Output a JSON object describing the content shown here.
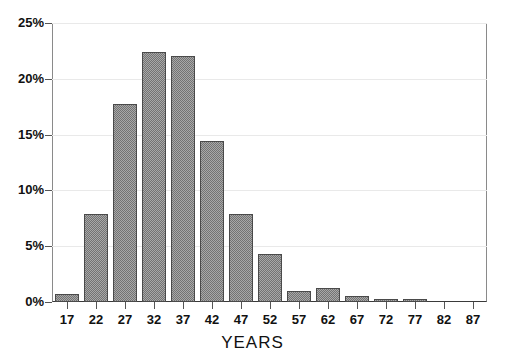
{
  "chart_data": {
    "type": "bar",
    "title": "",
    "subtitle": "",
    "xlabel": "YEARS",
    "ylabel": "",
    "categories": [
      "17",
      "22",
      "27",
      "32",
      "37",
      "42",
      "47",
      "52",
      "57",
      "62",
      "67",
      "72",
      "77",
      "82",
      "87"
    ],
    "values": [
      0.7,
      7.9,
      17.7,
      22.4,
      22.0,
      14.4,
      7.9,
      4.3,
      1.0,
      1.3,
      0.5,
      0.3,
      0.3,
      0.0,
      0.0
    ],
    "series": [
      {
        "name": "Percent",
        "values": [
          0.7,
          7.9,
          17.7,
          22.4,
          22.0,
          14.4,
          7.9,
          4.3,
          1.0,
          1.3,
          0.5,
          0.3,
          0.3,
          0.0,
          0.0
        ]
      }
    ],
    "ylim": [
      0,
      25
    ],
    "yticks": [
      0,
      5,
      10,
      15,
      20,
      25
    ],
    "ytick_labels": [
      "0%",
      "5%",
      "10%",
      "15%",
      "20%",
      "25%"
    ],
    "xtick_labels": [
      "17",
      "22",
      "27",
      "32",
      "37",
      "42",
      "47",
      "52",
      "57",
      "62",
      "67",
      "72",
      "77",
      "82",
      "87"
    ],
    "grid": "horizontal",
    "legend": "none",
    "bar_fill": "#a8a8a8",
    "bar_pattern": "crosshatch-dither",
    "bar_edge_color": "#4a4a4a",
    "grid_color": "#e9e9e9",
    "axis_color": "#555555",
    "background": "#ffffff",
    "annotations": []
  }
}
